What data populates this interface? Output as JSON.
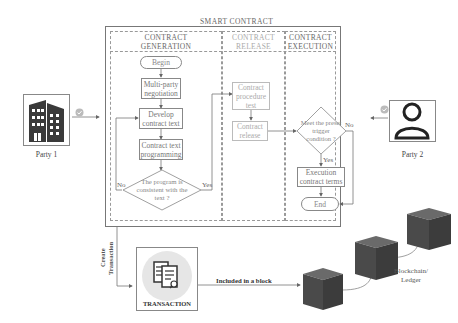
{
  "diagram": {
    "title": "SMART CONTRACT",
    "lanes": [
      {
        "id": "generation",
        "header_line1": "CONTRACT",
        "header_line2": "GENERATION"
      },
      {
        "id": "release",
        "header_line1": "CONTRACT",
        "header_line2": "RELEASE"
      },
      {
        "id": "execution",
        "header_line1": "CONTRACT",
        "header_line2": "EXECUTION"
      }
    ],
    "generation": {
      "begin": "Begin",
      "step1": "Multi-party negotiation",
      "step2": "Develop contract text",
      "step3": "Contract text programming",
      "decision": "The program is consistent with the text ?",
      "no_label": "No",
      "yes_label": "Yes"
    },
    "release": {
      "step1": "Contract procedure test",
      "step2": "Contract release"
    },
    "execution": {
      "decision": "Meet the preset trigger condition ?",
      "no_label": "No",
      "yes_label": "Yes",
      "step1": "Execution contract terms",
      "end": "End"
    },
    "parties": [
      {
        "label": "Party 1",
        "icon": "building-icon",
        "badge": "check-badge-icon"
      },
      {
        "label": "Party 2",
        "icon": "user-icon",
        "badge": "check-badge-icon"
      }
    ],
    "transaction": {
      "create_label_line1": "Create",
      "create_label_line2": "Transaction",
      "label": "TRANSACTION",
      "icon": "document-search-icon",
      "included_label": "Included in a block"
    },
    "blockchain": {
      "label_line1": "Blockchain/",
      "label_line2": "Ledger",
      "blocks": 3
    },
    "colors": {
      "line": "#777777",
      "block": "#4a4a4a",
      "building": "#3a3a3a",
      "badge": "#bbbbbb",
      "transaction_circle": "#e6e6e6"
    }
  }
}
